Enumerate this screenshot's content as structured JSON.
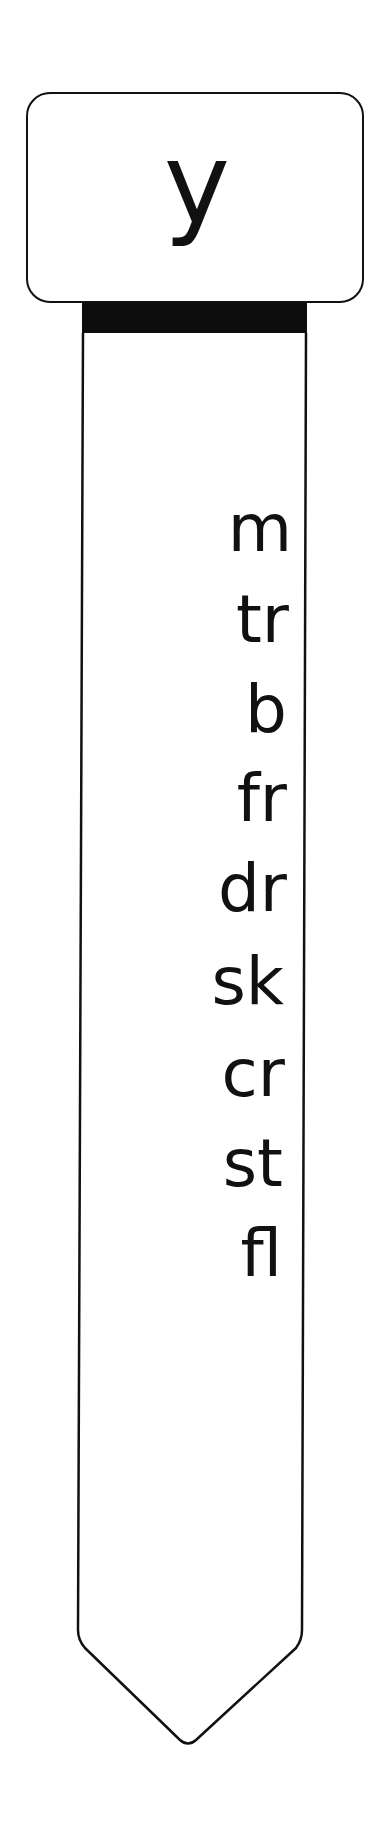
{
  "header": {
    "letter": "y"
  },
  "words": [
    {
      "text": "m"
    },
    {
      "text": "tr"
    },
    {
      "text": "b"
    },
    {
      "text": "fr"
    },
    {
      "text": "dr"
    },
    {
      "text": "sk"
    },
    {
      "text": "cr"
    },
    {
      "text": "st"
    },
    {
      "text": "fl"
    }
  ],
  "colors": {
    "ink": "#111111",
    "background": "#ffffff",
    "band": "#0d0d0d"
  }
}
